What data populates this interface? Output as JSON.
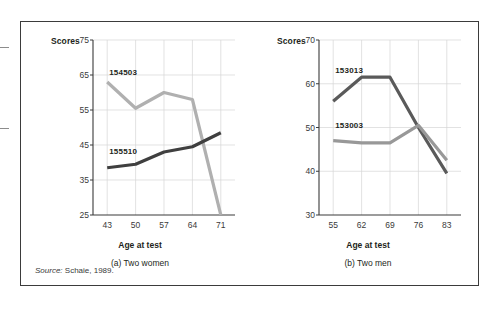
{
  "figure": {
    "source_prefix": "Source:",
    "source_text": "Schaie, 1989."
  },
  "chart_data": [
    {
      "type": "line",
      "title": "(a) Two women",
      "panel_id": "a",
      "xlabel": "Age at test",
      "ylabel": "Scores",
      "x": [
        43,
        50,
        57,
        64,
        71
      ],
      "xticks": [
        "43",
        "50",
        "57",
        "64",
        "71"
      ],
      "yticks": [
        "75",
        "65",
        "55",
        "45",
        "35",
        "25"
      ],
      "xlim": [
        39.5,
        74.5
      ],
      "ylim": [
        25,
        75
      ],
      "grid": true,
      "legend": "inline-labels",
      "series": [
        {
          "name": "154503",
          "label": "154503",
          "color": "#b0b0b0",
          "values": [
            63.0,
            55.5,
            60.0,
            58.0,
            25.0
          ],
          "label_x": 43,
          "label_y": 65.5
        },
        {
          "name": "155510",
          "label": "155510",
          "color": "#3f3f3f",
          "values": [
            38.5,
            39.5,
            43.0,
            44.5,
            48.5
          ],
          "label_x": 43,
          "label_y": 43.0
        }
      ]
    },
    {
      "type": "line",
      "title": "(b) Two men",
      "panel_id": "b",
      "xlabel": "Age at test",
      "ylabel": "Scores",
      "x": [
        55,
        62,
        69,
        76,
        83
      ],
      "xticks": [
        "55",
        "62",
        "69",
        "76",
        "83"
      ],
      "yticks": [
        "70",
        "60",
        "50",
        "40",
        "30"
      ],
      "xlim": [
        51.5,
        86.5
      ],
      "ylim": [
        30,
        70
      ],
      "grid": true,
      "legend": "inline-labels",
      "series": [
        {
          "name": "153013",
          "label": "153013",
          "color": "#5a5a5a",
          "values": [
            56.0,
            61.5,
            61.5,
            50.0,
            39.5
          ],
          "label_x": 55,
          "label_y": 63.0
        },
        {
          "name": "153003",
          "label": "153003",
          "color": "#989898",
          "values": [
            47.0,
            46.5,
            46.5,
            50.5,
            42.5
          ],
          "label_x": 55,
          "label_y": 50.3
        }
      ]
    }
  ]
}
